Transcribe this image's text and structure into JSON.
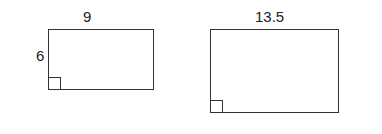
{
  "figure": {
    "rect1": {
      "width_label": "9",
      "height_label": "6"
    },
    "rect2": {
      "width_label": "13.5"
    }
  }
}
